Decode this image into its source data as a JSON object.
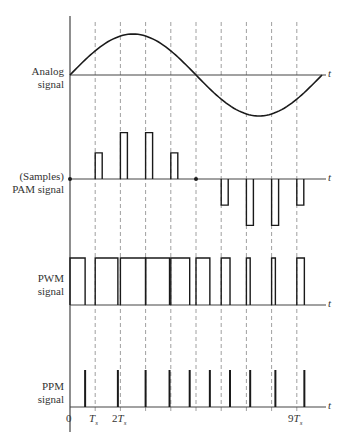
{
  "figure": {
    "time_axis_label": "t",
    "colors": {
      "signal": "#1a1a1a",
      "axis": "#444444",
      "dashed": "#888888",
      "background": "#ffffff"
    }
  },
  "rows": [
    {
      "id": "analog",
      "label_line1": "Analog",
      "label_line2": "signal"
    },
    {
      "id": "pam",
      "label_line1": "(Samples)",
      "label_line2": "PAM signal"
    },
    {
      "id": "pwm",
      "label_line1": "PWM",
      "label_line2": "signal"
    },
    {
      "id": "ppm",
      "label_line1": "PPM",
      "label_line2": "signal"
    }
  ],
  "x_ticks": [
    {
      "label": "0",
      "sym": "",
      "sub": ""
    },
    {
      "label": "",
      "sym": "T",
      "sub": "s"
    },
    {
      "label": "2",
      "sym": "T",
      "sub": "s"
    },
    {
      "label": "9",
      "sym": "T",
      "sub": "s"
    }
  ],
  "waveforms": {
    "sample_instants_Ts": [
      1,
      2,
      3,
      4,
      5,
      6,
      7,
      8,
      9
    ],
    "analog": {
      "shape": "one period of sine over 0..10Ts",
      "zero_crossings_Ts": [
        0,
        5,
        10
      ]
    },
    "pam_amplitudes": [
      0.45,
      0.8,
      0.8,
      0.45,
      0,
      -0.45,
      -0.8,
      -0.8,
      -0.45
    ],
    "pwm_pulses_Ts": [
      {
        "start": 0,
        "end": 0.6
      },
      {
        "start": 1,
        "end": 1.9
      },
      {
        "start": 2,
        "end": 3.0
      },
      {
        "start": 3,
        "end": 3.95
      },
      {
        "start": 4,
        "end": 4.75
      },
      {
        "start": 5,
        "end": 5.55
      },
      {
        "start": 6,
        "end": 6.35
      },
      {
        "start": 7,
        "end": 7.15
      },
      {
        "start": 8,
        "end": 8.15
      },
      {
        "start": 9,
        "end": 9.3
      }
    ],
    "ppm_positions_Ts": [
      0.6,
      1.9,
      3.0,
      3.95,
      4.75,
      5.55,
      6.35,
      7.15,
      8.15,
      9.3
    ]
  }
}
